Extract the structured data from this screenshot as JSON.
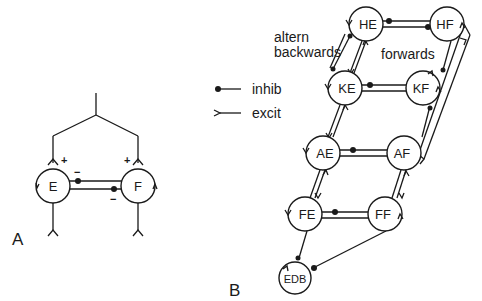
{
  "panel_a": {
    "label": "A",
    "nodes": {
      "e": "E",
      "f": "F"
    },
    "signs": {
      "e_plus": "+",
      "f_plus": "+",
      "e_minus": "−",
      "f_minus": "−"
    }
  },
  "panel_b": {
    "label": "B",
    "nodes": {
      "he": "HE",
      "hf": "HF",
      "ke": "KE",
      "kf": "KF",
      "ae": "AE",
      "af": "AF",
      "fe": "FE",
      "ff": "FF",
      "edb": "EDB"
    },
    "annotations": {
      "altern_line1": "altern",
      "altern_line2": "backwards",
      "forwards": "forwards"
    },
    "legend": {
      "inhib": "inhib",
      "excit": "excit"
    }
  },
  "colors": {
    "ink": "#1a1a1a",
    "background": "#ffffff"
  }
}
